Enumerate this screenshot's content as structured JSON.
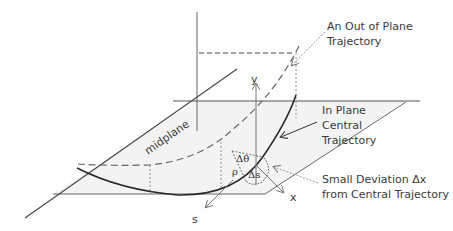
{
  "diagram": {
    "labels": {
      "out_of_plane_line1": "An Out of Plane",
      "out_of_plane_line2": "Trajectory",
      "in_plane_line1": "In Plane",
      "in_plane_line2": "Central",
      "in_plane_line3": "Trajectory",
      "deviation_line1": "Small Deviation Δx",
      "deviation_line2": "from Central Trajectory",
      "midplane": "midplane",
      "axis_y": "y",
      "axis_x": "x",
      "axis_s": "s",
      "delta_theta": "Δθ",
      "rho": "ρ",
      "delta_s": "Δs"
    },
    "colors": {
      "plane_fill": "#f2f2f2",
      "line": "#555555",
      "curve": "#2a2a2a",
      "arrow": "#777777"
    }
  }
}
